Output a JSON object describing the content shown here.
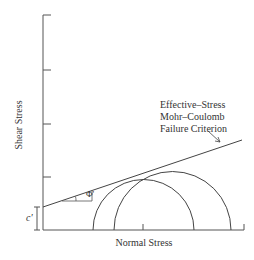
{
  "diagram": {
    "y_axis_label": "Shear Stress",
    "x_axis_label": "Normal Stress",
    "criterion_label_lines": [
      "Effective–Stress",
      "Mohr–Coulomb",
      "Failure Criterion"
    ],
    "cohesion_label": "c'",
    "friction_angle_label": "Φ'",
    "line_color": "#444444",
    "axis_color": "#555555"
  }
}
